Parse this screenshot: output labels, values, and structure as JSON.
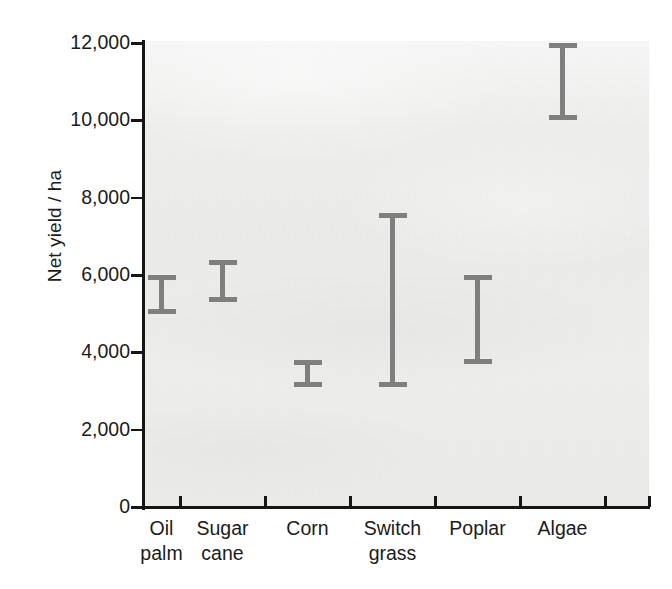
{
  "chart_data": {
    "type": "bar",
    "subtype": "error-bar-range",
    "title": "",
    "xlabel": "",
    "ylabel": "Net yield / ha",
    "ylim": [
      0,
      12000
    ],
    "yticks": [
      0,
      2000,
      4000,
      6000,
      8000,
      10000,
      12000
    ],
    "ytick_labels": [
      "0",
      "2,000",
      "4,000",
      "6,000",
      "8,000",
      "10,000",
      "12,000"
    ],
    "grid": false,
    "legend": false,
    "categories": [
      "Oil palm",
      "Sugar cane",
      "Corn",
      "Switch grass",
      "Poplar",
      "Algae"
    ],
    "category_lines": [
      [
        "Oil",
        "palm"
      ],
      [
        "Sugar",
        "cane"
      ],
      [
        "Corn",
        ""
      ],
      [
        "Switch",
        "grass"
      ],
      [
        "Poplar",
        ""
      ],
      [
        "Algae",
        ""
      ]
    ],
    "series": [
      {
        "name": "Net yield range",
        "low": [
          5000,
          5300,
          3100,
          3100,
          3700,
          10000
        ],
        "high": [
          6000,
          6400,
          3800,
          7600,
          6000,
          12000
        ],
        "color": "#7f7f7f"
      }
    ],
    "points": [
      {
        "category": "Oil palm",
        "low": 5000,
        "high": 6000
      },
      {
        "category": "Sugar cane",
        "low": 5300,
        "high": 6400
      },
      {
        "category": "Corn",
        "low": 3100,
        "high": 3800
      },
      {
        "category": "Switch grass",
        "low": 3100,
        "high": 7600
      },
      {
        "category": "Poplar",
        "low": 3700,
        "high": 6000
      },
      {
        "category": "Algae",
        "low": 10000,
        "high": 12000
      }
    ],
    "colors": {
      "bar": "#7f7f7f",
      "axis": "#151515",
      "text": "#1b1b1b",
      "plot_background": "#ececeb",
      "figure_background": "#ffffff"
    }
  }
}
